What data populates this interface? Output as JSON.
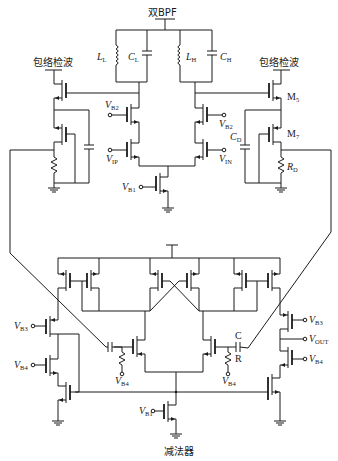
{
  "diagram": {
    "title_bottom": "减法器",
    "top_output": "双BPF",
    "envelope_left": "包络检波",
    "envelope_right": "包络检波",
    "labels": {
      "LL": {
        "main": "L",
        "sub": "L"
      },
      "CL": {
        "main": "C",
        "sub": "L"
      },
      "LH": {
        "main": "L",
        "sub": "H"
      },
      "CH": {
        "main": "C",
        "sub": "H"
      },
      "M5": {
        "main": "M",
        "sub": "5"
      },
      "M7": {
        "main": "M",
        "sub": "7"
      },
      "CD": {
        "main": "C",
        "sub": "D"
      },
      "RD": {
        "main": "R",
        "sub": "D"
      },
      "VB2_left": {
        "main": "V",
        "sub": "B2"
      },
      "VB2_right": {
        "main": "V",
        "sub": "B2"
      },
      "VIP": {
        "main": "V",
        "sub": "IP"
      },
      "VIN": {
        "main": "V",
        "sub": "IN"
      },
      "VB1_top": {
        "main": "V",
        "sub": "B1"
      },
      "VB3_left": {
        "main": "V",
        "sub": "B3"
      },
      "VB4_left": {
        "main": "V",
        "sub": "B4"
      },
      "VB4_mid_left": {
        "main": "V",
        "sub": "B4"
      },
      "VB4_mid_right": {
        "main": "V",
        "sub": "B4"
      },
      "VB3_right": {
        "main": "V",
        "sub": "B3"
      },
      "VOUT": {
        "main": "V",
        "sub": "OUT"
      },
      "VB4_right": {
        "main": "V",
        "sub": "B4"
      },
      "VB1_bottom": {
        "main": "V",
        "sub": "B1"
      },
      "C": "C",
      "R": "R"
    },
    "blocks": [
      {
        "name": "dual-bandpass-filter",
        "label": "双BPF"
      },
      {
        "name": "envelope-detector-left",
        "label": "包络检波"
      },
      {
        "name": "envelope-detector-right",
        "label": "包络检波"
      },
      {
        "name": "subtractor",
        "label": "减法器"
      }
    ],
    "colors": {
      "line": "#1a1a1a",
      "background": "#ffffff"
    }
  }
}
